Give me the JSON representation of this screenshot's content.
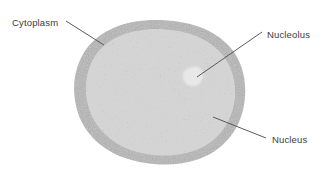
{
  "figure": {
    "background_color": "#ffffff",
    "width": 330,
    "height": 171
  },
  "labels": {
    "cytoplasm": "Cytoplasm",
    "nucleolus": "Nucleolus",
    "nucleus": "Nucleus"
  },
  "colors": {
    "text": "#3b3b3b",
    "leader_line": "#4a4a4a",
    "cytoplasm_rim": "#9a9a9a",
    "nucleus_light": "#c2c2c2",
    "nucleus_dark": "#7c7c7c",
    "nucleolus": "#e9e9e9",
    "background": "#ffffff"
  },
  "structures": [
    {
      "name": "cytoplasm",
      "label": "Cytoplasm",
      "description": "Darker uniform gray outer rim of the rounded cell",
      "fill": "#9a9a9a"
    },
    {
      "name": "nucleus",
      "label": "Nucleus",
      "description": "Large mottled speckled region filling the cell interior",
      "fill": "#a8a8a8"
    },
    {
      "name": "nucleolus",
      "label": "Nucleolus",
      "description": "Small pale irregular oval inside the upper-right of the nucleus",
      "fill": "#e9e9e9"
    }
  ],
  "leaders": [
    {
      "name": "cytoplasm-leader",
      "from_x": 66,
      "from_y": 21,
      "to_x": 104,
      "to_y": 45
    },
    {
      "name": "nucleolus-leader",
      "from_x": 262,
      "from_y": 32,
      "to_x": 197,
      "to_y": 77
    },
    {
      "name": "nucleus-leader",
      "from_x": 266,
      "from_y": 138,
      "to_x": 213,
      "to_y": 117
    }
  ]
}
